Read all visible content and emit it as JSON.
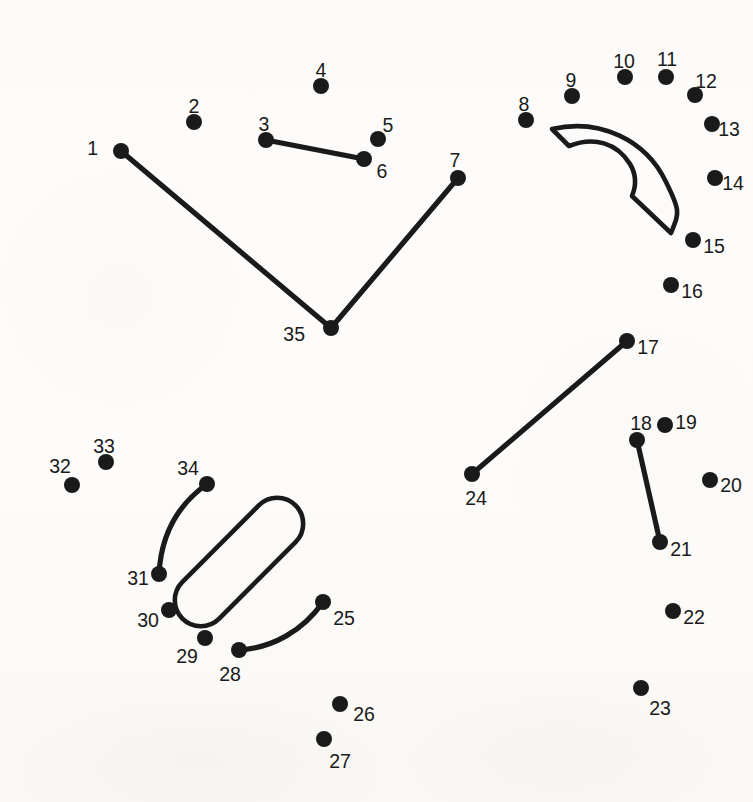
{
  "page": {
    "width": 753,
    "height": 802,
    "background_color": "#fdfdfc",
    "ink_color": "#1a1a1a",
    "dot_radius": 8,
    "label_font_size": 19.5,
    "total_dots": 35
  },
  "dots": [
    {
      "number": "1",
      "x": 121,
      "y": 151,
      "label_x": 98,
      "label_y": 150,
      "anchor": "end"
    },
    {
      "number": "2",
      "x": 194,
      "y": 122,
      "label_x": 194,
      "label_y": 108,
      "anchor": "middle"
    },
    {
      "number": "3",
      "x": 266,
      "y": 140,
      "label_x": 264,
      "label_y": 126,
      "anchor": "middle"
    },
    {
      "number": "4",
      "x": 321,
      "y": 86,
      "label_x": 321,
      "label_y": 72,
      "anchor": "middle"
    },
    {
      "number": "5",
      "x": 378,
      "y": 139,
      "label_x": 388,
      "label_y": 127,
      "anchor": "middle"
    },
    {
      "number": "6",
      "x": 364,
      "y": 159,
      "label_x": 382,
      "label_y": 173,
      "anchor": "middle"
    },
    {
      "number": "7",
      "x": 458,
      "y": 178,
      "label_x": 455,
      "label_y": 162,
      "anchor": "middle"
    },
    {
      "number": "8",
      "x": 526,
      "y": 120,
      "label_x": 524,
      "label_y": 106,
      "anchor": "middle"
    },
    {
      "number": "9",
      "x": 572,
      "y": 96,
      "label_x": 571,
      "label_y": 82,
      "anchor": "middle"
    },
    {
      "number": "10",
      "x": 625,
      "y": 77,
      "label_x": 624,
      "label_y": 63,
      "anchor": "middle"
    },
    {
      "number": "11",
      "x": 666,
      "y": 77,
      "label_x": 667,
      "label_y": 61,
      "anchor": "middle"
    },
    {
      "number": "12",
      "x": 695,
      "y": 95,
      "label_x": 706,
      "label_y": 83,
      "anchor": "middle"
    },
    {
      "number": "13",
      "x": 712,
      "y": 124,
      "label_x": 729,
      "label_y": 131,
      "anchor": "middle"
    },
    {
      "number": "14",
      "x": 715,
      "y": 178,
      "label_x": 733,
      "label_y": 185,
      "anchor": "middle"
    },
    {
      "number": "15",
      "x": 693,
      "y": 240,
      "label_x": 714,
      "label_y": 248,
      "anchor": "middle"
    },
    {
      "number": "16",
      "x": 671,
      "y": 285,
      "label_x": 692,
      "label_y": 293,
      "anchor": "middle"
    },
    {
      "number": "17",
      "x": 627,
      "y": 341,
      "label_x": 648,
      "label_y": 349,
      "anchor": "middle"
    },
    {
      "number": "18",
      "x": 637,
      "y": 440,
      "label_x": 641,
      "label_y": 425,
      "anchor": "middle"
    },
    {
      "number": "19",
      "x": 665,
      "y": 425,
      "label_x": 686,
      "label_y": 424,
      "anchor": "middle"
    },
    {
      "number": "20",
      "x": 710,
      "y": 480,
      "label_x": 731,
      "label_y": 487,
      "anchor": "middle"
    },
    {
      "number": "21",
      "x": 660,
      "y": 542,
      "label_x": 681,
      "label_y": 551,
      "anchor": "middle"
    },
    {
      "number": "22",
      "x": 673,
      "y": 611,
      "label_x": 694,
      "label_y": 619,
      "anchor": "middle"
    },
    {
      "number": "23",
      "x": 641,
      "y": 688,
      "label_x": 660,
      "label_y": 710,
      "anchor": "middle"
    },
    {
      "number": "24",
      "x": 472,
      "y": 474,
      "label_x": 476,
      "label_y": 500,
      "anchor": "middle"
    },
    {
      "number": "25",
      "x": 323,
      "y": 602,
      "label_x": 344,
      "label_y": 620,
      "anchor": "middle"
    },
    {
      "number": "26",
      "x": 340,
      "y": 704,
      "label_x": 364,
      "label_y": 716,
      "anchor": "middle"
    },
    {
      "number": "27",
      "x": 324,
      "y": 739,
      "label_x": 340,
      "label_y": 763,
      "anchor": "middle"
    },
    {
      "number": "28",
      "x": 239,
      "y": 650,
      "label_x": 230,
      "label_y": 676,
      "anchor": "middle"
    },
    {
      "number": "29",
      "x": 205,
      "y": 638,
      "label_x": 187,
      "label_y": 658,
      "anchor": "middle"
    },
    {
      "number": "30",
      "x": 169,
      "y": 610,
      "label_x": 148,
      "label_y": 622,
      "anchor": "middle"
    },
    {
      "number": "31",
      "x": 159,
      "y": 574,
      "label_x": 138,
      "label_y": 580,
      "anchor": "middle"
    },
    {
      "number": "32",
      "x": 72,
      "y": 485,
      "label_x": 60,
      "label_y": 468,
      "anchor": "middle"
    },
    {
      "number": "33",
      "x": 106,
      "y": 462,
      "label_x": 104,
      "label_y": 448,
      "anchor": "middle"
    },
    {
      "number": "34",
      "x": 207,
      "y": 484,
      "label_x": 188,
      "label_y": 470,
      "anchor": "middle"
    },
    {
      "number": "35",
      "x": 331,
      "y": 328,
      "label_x": 305,
      "label_y": 336,
      "anchor": "end"
    }
  ],
  "strokes": [
    {
      "name": "stroke-1-35-7-vee",
      "from": "1",
      "to": "7",
      "d": "M 121 151 L 331 328 L 458 178"
    },
    {
      "name": "stroke-3-6",
      "from": "3",
      "to": "6",
      "d": "M 266 140 L 364 159"
    },
    {
      "name": "stroke-17-24",
      "from": "17",
      "to": "24",
      "d": "M 627 341 L 472 474"
    },
    {
      "name": "stroke-18-21",
      "from": "18",
      "to": "21",
      "d": "M 637 440 L 660 542"
    },
    {
      "name": "stroke-31-34-curve",
      "from": "31",
      "to": "34",
      "d": "M 159 574 C 161 536 176 506 207 484"
    },
    {
      "name": "stroke-28-25-curve",
      "from": "28",
      "to": "25",
      "d": "M 239 650 C 272 648 303 631 323 602"
    }
  ],
  "shapes": [
    {
      "name": "annulus-wedge-shape",
      "description": "curved quarter-ring wedge in upper right",
      "d": "M 552 129 C 600 118 646 140 666 182 C 681 212 679 213 671 233 L 632 196 C 637 184 636 174 630 164 C 617 143 594 136 569 146 Z"
    },
    {
      "name": "stadium-pill-shape",
      "description": "rotated rounded-rectangle (pill) in lower left",
      "cx": 239,
      "cy": 562,
      "rx": 80,
      "ry": 26,
      "rotation": -45,
      "corner_radius": 26
    }
  ]
}
